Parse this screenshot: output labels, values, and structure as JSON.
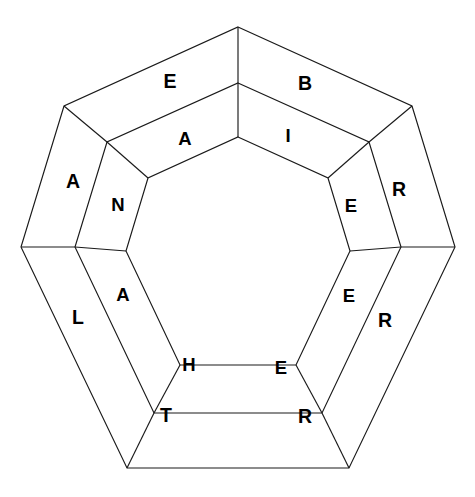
{
  "diagram": {
    "type": "nested-polygon-word-wheel",
    "sides": 7,
    "rings": 2,
    "background_color": "#ffffff",
    "line_color": "#1a1a1a",
    "letter_color": "#000000",
    "geometry": {
      "center_x": 238,
      "center_y": 251,
      "outer_radius": 224,
      "middle_radius": 168,
      "inner_radius": 116,
      "rotation_degrees": -90,
      "outer_top_vertex": [
        239,
        29
      ],
      "left_vertex": [
        25,
        247
      ],
      "right_vertex": [
        451,
        247
      ],
      "bottom_vertex": [
        239,
        473
      ],
      "inner_top_vertex": [
        239,
        137
      ]
    },
    "outer_ring": {
      "name": "outer-ring",
      "letters": [
        "B",
        "R",
        "R",
        "T",
        "L",
        "A",
        "E"
      ],
      "cells": [
        {
          "letter": "B",
          "position": "top-right",
          "x": 305,
          "y": 85
        },
        {
          "letter": "R",
          "position": "right-upper",
          "x": 399,
          "y": 191
        },
        {
          "letter": "R",
          "position": "right-lower",
          "x": 385,
          "y": 322
        },
        {
          "letter": "T",
          "position": "bottom-left",
          "x": 166,
          "y": 417
        },
        {
          "letter": "L",
          "position": "left-lower",
          "x": 78,
          "y": 319
        },
        {
          "letter": "A",
          "position": "left-upper",
          "x": 73,
          "y": 183
        },
        {
          "letter": "E",
          "position": "top-left",
          "x": 170,
          "y": 83
        }
      ],
      "bottom_right_cell": {
        "letter": "R",
        "position": "bottom-right",
        "x": 305,
        "y": 418
      }
    },
    "inner_ring": {
      "name": "inner-ring",
      "letters": [
        "I",
        "E",
        "E",
        "E",
        "H",
        "A",
        "N",
        "A"
      ],
      "cells": [
        {
          "letter": "I",
          "position": "top-right",
          "x": 288,
          "y": 137
        },
        {
          "letter": "E",
          "position": "right-upper",
          "x": 351,
          "y": 207
        },
        {
          "letter": "E",
          "position": "right-lower",
          "x": 349,
          "y": 297
        },
        {
          "letter": "E",
          "position": "bottom-right",
          "x": 281,
          "y": 369
        },
        {
          "letter": "H",
          "position": "bottom-left",
          "x": 189,
          "y": 366
        },
        {
          "letter": "A",
          "position": "left-lower",
          "x": 123,
          "y": 296
        },
        {
          "letter": "N",
          "position": "left-upper",
          "x": 118,
          "y": 206
        },
        {
          "letter": "A",
          "position": "top-left",
          "x": 185,
          "y": 140
        }
      ]
    },
    "core": {
      "name": "inner-heptagon-core",
      "content": "",
      "filled": false
    }
  }
}
